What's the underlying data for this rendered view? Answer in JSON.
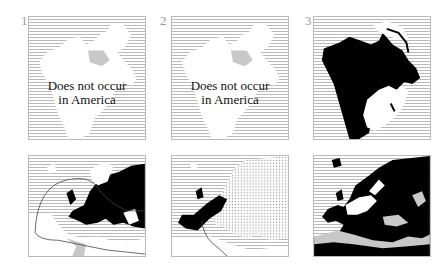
{
  "figure": {
    "panels": [
      {
        "number": "1",
        "region": "North America",
        "label_line1": "Does not occur",
        "label_line2": "in America"
      },
      {
        "number": "2",
        "region": "North America",
        "label_line1": "Does not occur",
        "label_line2": "in America"
      },
      {
        "number": "3",
        "region": "North America",
        "label_line1": "",
        "label_line2": ""
      },
      {
        "number": "",
        "region": "Europe"
      },
      {
        "number": "",
        "region": "Europe"
      },
      {
        "number": "",
        "region": "Europe"
      }
    ],
    "legend_fills": {
      "sea": "horizontal-hatch",
      "distribution": "#000000",
      "land_absent": "#ffffff",
      "stipple": "dotted"
    }
  }
}
